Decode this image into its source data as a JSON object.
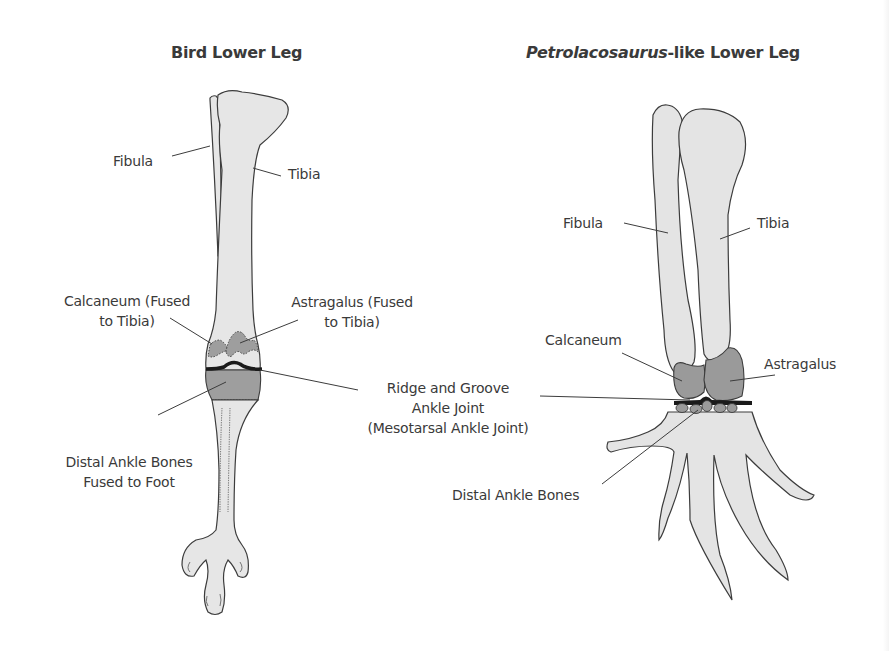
{
  "panels": {
    "bird": {
      "title": "Bird Lower Leg",
      "labels": {
        "fibula": "Fibula",
        "tibia": "Tibia",
        "calcaneum_1": "Calcaneum (Fused",
        "calcaneum_2": "to Tibia)",
        "astragalus_1": "Astragalus (Fused",
        "astragalus_2": "to Tibia)",
        "distal_1": "Distal Ankle Bones",
        "distal_2": "Fused to Foot"
      }
    },
    "petrolacosaurus": {
      "title_italic": "Petrolacosaurus",
      "title_rest": "-like Lower Leg",
      "labels": {
        "fibula": "Fibula",
        "tibia": "Tibia",
        "calcaneum": "Calcaneum",
        "astragalus": "Astragalus",
        "distal": "Distal Ankle Bones"
      }
    }
  },
  "shared": {
    "joint_1": "Ridge and Groove",
    "joint_2": "Ankle Joint",
    "joint_3": "(Mesotarsal Ankle Joint)"
  },
  "colors": {
    "bone_fill": "#e4e4e4",
    "ankle_fill": "#9a9a9a",
    "outline": "#3c3c3c",
    "joint_line": "#1a1a1a",
    "text": "#3a3a3a"
  }
}
